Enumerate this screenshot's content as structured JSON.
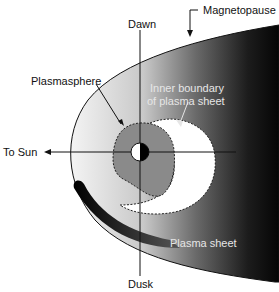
{
  "diagram": {
    "labels": {
      "dawn": "Dawn",
      "dusk": "Dusk",
      "to_sun": "To Sun",
      "magnetopause": "Magnetopause",
      "plasmasphere": "Plasmasphere",
      "inner_boundary_line1": "Inner boundary",
      "inner_boundary_line2": "of plasma sheet",
      "plasma_sheet": "Plasma sheet"
    },
    "colors": {
      "magnetosphere_light": "#f2f2f2",
      "magnetosphere_dark": "#0a0a0a",
      "plasmasphere": "#8a8a8a",
      "plasma_sheet_inner": "#ffffff",
      "earth_night": "#000000",
      "earth_day": "#ffffff"
    }
  }
}
